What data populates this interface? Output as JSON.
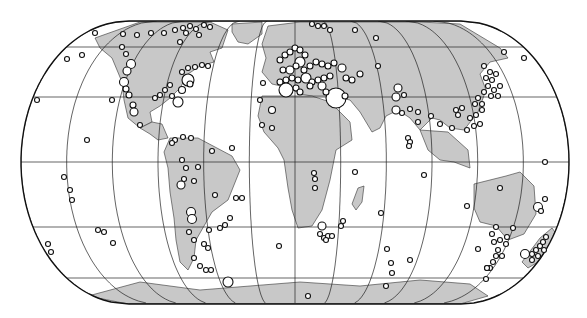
{
  "map": {
    "projection": "Eckert IV (pseudocylindrical, equal-area)",
    "center_x": 295,
    "equator_y": 162,
    "top_y": 21,
    "bottom_y": 304,
    "half_width": 274,
    "flat_half_width": 166,
    "parallels_y": [
      21,
      47,
      97,
      162,
      227,
      278,
      304
    ],
    "meridian_count": 13,
    "colors": {
      "land": "#c8c8c8",
      "ocean": "#ffffff",
      "lines": "#222222",
      "marker_fill": "#ffffff",
      "marker_stroke": "#111111"
    }
  },
  "land": [
    {
      "name": "north-america",
      "points": "95,38 140,22 210,22 228,30 222,48 210,52 214,62 200,66 188,74 180,88 170,98 160,106 150,112 152,122 140,128 128,118 124,100 122,82 112,58 100,48"
    },
    {
      "name": "greenland",
      "points": "232,24 262,22 262,34 248,44 238,42 232,32"
    },
    {
      "name": "central-america",
      "points": "140,128 152,122 162,124 168,138 158,140 150,134"
    },
    {
      "name": "south-america",
      "points": "170,138 198,138 232,156 240,170 228,200 212,212 204,226 196,240 194,258 188,270 180,262 176,240 174,218 170,192 168,168 164,152"
    },
    {
      "name": "europe-asia",
      "points": "262,44 268,26 300,22 330,22 420,22 460,24 480,36 500,48 508,58 490,62 480,74 486,90 478,112 464,130 450,128 440,120 432,118 420,130 410,118 398,110 386,116 380,128 372,132 360,112 350,100 330,96 312,96 300,94 290,88 272,84 262,72 266,58"
    },
    {
      "name": "africa",
      "points": "262,96 312,96 330,102 350,122 352,140 336,150 330,180 322,210 312,226 298,228 292,210 288,188 284,160 278,148 264,132 258,116"
    },
    {
      "name": "madagascar",
      "points": "358,188 364,186 362,202 356,210 352,204"
    },
    {
      "name": "southeast-asia",
      "points": "420,130 448,132 468,150 470,168 454,162 440,160 428,150"
    },
    {
      "name": "australia",
      "points": "474,184 506,176 520,172 534,186 536,214 524,234 508,240 496,226 480,222 474,208"
    },
    {
      "name": "new-zealand",
      "points": "540,238 552,228 558,236 548,256 528,268 522,262"
    },
    {
      "name": "antarctica",
      "points": "88,296 140,282 200,290 250,286 300,282 360,286 420,280 470,284 488,296 460,304 128,304"
    }
  ],
  "markers": [
    {
      "x": 95,
      "y": 33,
      "r": 2.5
    },
    {
      "x": 123,
      "y": 34,
      "r": 2.5
    },
    {
      "x": 137,
      "y": 35,
      "r": 2.5
    },
    {
      "x": 151,
      "y": 33,
      "r": 2.5
    },
    {
      "x": 164,
      "y": 33,
      "r": 2.5
    },
    {
      "x": 175,
      "y": 30,
      "r": 2.5
    },
    {
      "x": 183,
      "y": 28,
      "r": 2.5
    },
    {
      "x": 190,
      "y": 26,
      "r": 2.5
    },
    {
      "x": 196,
      "y": 29,
      "r": 2.5
    },
    {
      "x": 204,
      "y": 25,
      "r": 2.5
    },
    {
      "x": 186,
      "y": 33,
      "r": 2.5
    },
    {
      "x": 199,
      "y": 35,
      "r": 2.5
    },
    {
      "x": 210,
      "y": 27,
      "r": 2.5
    },
    {
      "x": 180,
      "y": 42,
      "r": 2.5
    },
    {
      "x": 67,
      "y": 59,
      "r": 2.5
    },
    {
      "x": 82,
      "y": 55,
      "r": 2.5
    },
    {
      "x": 122,
      "y": 47,
      "r": 2.5
    },
    {
      "x": 126,
      "y": 54,
      "r": 2.5
    },
    {
      "x": 131,
      "y": 64,
      "r": 4.5
    },
    {
      "x": 127,
      "y": 71,
      "r": 4
    },
    {
      "x": 124,
      "y": 82,
      "r": 4.5
    },
    {
      "x": 126,
      "y": 89,
      "r": 3
    },
    {
      "x": 129,
      "y": 95,
      "r": 3
    },
    {
      "x": 133,
      "y": 105,
      "r": 3
    },
    {
      "x": 134,
      "y": 112,
      "r": 4
    },
    {
      "x": 140,
      "y": 125,
      "r": 2.5
    },
    {
      "x": 37,
      "y": 100,
      "r": 2.5
    },
    {
      "x": 112,
      "y": 100,
      "r": 2.5
    },
    {
      "x": 87,
      "y": 140,
      "r": 2.5
    },
    {
      "x": 182,
      "y": 72,
      "r": 2.5
    },
    {
      "x": 188,
      "y": 68,
      "r": 2.5
    },
    {
      "x": 195,
      "y": 67,
      "r": 2.5
    },
    {
      "x": 202,
      "y": 65,
      "r": 2.5
    },
    {
      "x": 208,
      "y": 66,
      "r": 2.5
    },
    {
      "x": 188,
      "y": 80,
      "r": 6
    },
    {
      "x": 190,
      "y": 84,
      "r": 3
    },
    {
      "x": 170,
      "y": 85,
      "r": 2.5
    },
    {
      "x": 165,
      "y": 90,
      "r": 2.5
    },
    {
      "x": 160,
      "y": 95,
      "r": 2.5
    },
    {
      "x": 155,
      "y": 98,
      "r": 2.5
    },
    {
      "x": 182,
      "y": 90,
      "r": 3.5
    },
    {
      "x": 178,
      "y": 102,
      "r": 5
    },
    {
      "x": 172,
      "y": 96,
      "r": 2.5
    },
    {
      "x": 263,
      "y": 83,
      "r": 2.5
    },
    {
      "x": 260,
      "y": 100,
      "r": 2.5
    },
    {
      "x": 272,
      "y": 110,
      "r": 3.5
    },
    {
      "x": 272,
      "y": 128,
      "r": 2.5
    },
    {
      "x": 262,
      "y": 125,
      "r": 2.5
    },
    {
      "x": 175,
      "y": 140,
      "r": 2.5
    },
    {
      "x": 172,
      "y": 143,
      "r": 2.5
    },
    {
      "x": 183,
      "y": 137,
      "r": 2.5
    },
    {
      "x": 191,
      "y": 138,
      "r": 2.5
    },
    {
      "x": 212,
      "y": 151,
      "r": 2.5
    },
    {
      "x": 232,
      "y": 148,
      "r": 2.5
    },
    {
      "x": 182,
      "y": 160,
      "r": 2.5
    },
    {
      "x": 186,
      "y": 168,
      "r": 2.5
    },
    {
      "x": 198,
      "y": 167,
      "r": 2.5
    },
    {
      "x": 184,
      "y": 179,
      "r": 2.5
    },
    {
      "x": 181,
      "y": 185,
      "r": 4
    },
    {
      "x": 194,
      "y": 181,
      "r": 2.5
    },
    {
      "x": 215,
      "y": 195,
      "r": 2.5
    },
    {
      "x": 236,
      "y": 198,
      "r": 2.5
    },
    {
      "x": 242,
      "y": 198,
      "r": 2.5
    },
    {
      "x": 191,
      "y": 212,
      "r": 4.5
    },
    {
      "x": 192,
      "y": 219,
      "r": 4.5
    },
    {
      "x": 189,
      "y": 232,
      "r": 2.5
    },
    {
      "x": 194,
      "y": 240,
      "r": 2.5
    },
    {
      "x": 209,
      "y": 230,
      "r": 2.5
    },
    {
      "x": 220,
      "y": 228,
      "r": 2.5
    },
    {
      "x": 225,
      "y": 225,
      "r": 2.5
    },
    {
      "x": 230,
      "y": 218,
      "r": 2.5
    },
    {
      "x": 204,
      "y": 244,
      "r": 2.5
    },
    {
      "x": 208,
      "y": 248,
      "r": 2.5
    },
    {
      "x": 194,
      "y": 258,
      "r": 2.5
    },
    {
      "x": 200,
      "y": 266,
      "r": 2.5
    },
    {
      "x": 206,
      "y": 270,
      "r": 2.5
    },
    {
      "x": 211,
      "y": 270,
      "r": 2.5
    },
    {
      "x": 98,
      "y": 230,
      "r": 2.5
    },
    {
      "x": 104,
      "y": 232,
      "r": 2.5
    },
    {
      "x": 113,
      "y": 243,
      "r": 2.5
    },
    {
      "x": 48,
      "y": 244,
      "r": 2.5
    },
    {
      "x": 51,
      "y": 252,
      "r": 2.5
    },
    {
      "x": 64,
      "y": 177,
      "r": 2.5
    },
    {
      "x": 70,
      "y": 190,
      "r": 2.5
    },
    {
      "x": 72,
      "y": 200,
      "r": 2.5
    },
    {
      "x": 228,
      "y": 282,
      "r": 5
    },
    {
      "x": 279,
      "y": 246,
      "r": 2.5
    },
    {
      "x": 308,
      "y": 296,
      "r": 2.5
    },
    {
      "x": 280,
      "y": 60,
      "r": 3
    },
    {
      "x": 285,
      "y": 55,
      "r": 3
    },
    {
      "x": 290,
      "y": 52,
      "r": 3
    },
    {
      "x": 295,
      "y": 48,
      "r": 3
    },
    {
      "x": 300,
      "y": 50,
      "r": 3
    },
    {
      "x": 305,
      "y": 55,
      "r": 3
    },
    {
      "x": 300,
      "y": 62,
      "r": 5
    },
    {
      "x": 283,
      "y": 70,
      "r": 3
    },
    {
      "x": 290,
      "y": 70,
      "r": 4
    },
    {
      "x": 296,
      "y": 66,
      "r": 3
    },
    {
      "x": 304,
      "y": 70,
      "r": 3
    },
    {
      "x": 310,
      "y": 66,
      "r": 3
    },
    {
      "x": 316,
      "y": 62,
      "r": 3
    },
    {
      "x": 322,
      "y": 64,
      "r": 3
    },
    {
      "x": 328,
      "y": 66,
      "r": 3
    },
    {
      "x": 334,
      "y": 63,
      "r": 3
    },
    {
      "x": 342,
      "y": 68,
      "r": 4
    },
    {
      "x": 280,
      "y": 82,
      "r": 3
    },
    {
      "x": 286,
      "y": 80,
      "r": 3
    },
    {
      "x": 292,
      "y": 78,
      "r": 3
    },
    {
      "x": 298,
      "y": 80,
      "r": 3
    },
    {
      "x": 306,
      "y": 78,
      "r": 5
    },
    {
      "x": 312,
      "y": 82,
      "r": 3
    },
    {
      "x": 318,
      "y": 80,
      "r": 3
    },
    {
      "x": 324,
      "y": 78,
      "r": 3
    },
    {
      "x": 330,
      "y": 76,
      "r": 3
    },
    {
      "x": 346,
      "y": 78,
      "r": 3
    },
    {
      "x": 352,
      "y": 80,
      "r": 3
    },
    {
      "x": 360,
      "y": 74,
      "r": 3
    },
    {
      "x": 286,
      "y": 90,
      "r": 7
    },
    {
      "x": 296,
      "y": 88,
      "r": 3
    },
    {
      "x": 300,
      "y": 92,
      "r": 3
    },
    {
      "x": 310,
      "y": 86,
      "r": 3
    },
    {
      "x": 322,
      "y": 86,
      "r": 4
    },
    {
      "x": 336,
      "y": 98,
      "r": 10
    },
    {
      "x": 326,
      "y": 92,
      "r": 3
    },
    {
      "x": 345,
      "y": 96,
      "r": 3
    },
    {
      "x": 312,
      "y": 24,
      "r": 2.5
    },
    {
      "x": 318,
      "y": 26,
      "r": 2.5
    },
    {
      "x": 324,
      "y": 26,
      "r": 2.5
    },
    {
      "x": 330,
      "y": 30,
      "r": 2.5
    },
    {
      "x": 355,
      "y": 30,
      "r": 2.5
    },
    {
      "x": 376,
      "y": 38,
      "r": 2.5
    },
    {
      "x": 378,
      "y": 66,
      "r": 2.5
    },
    {
      "x": 398,
      "y": 88,
      "r": 4
    },
    {
      "x": 396,
      "y": 97,
      "r": 4
    },
    {
      "x": 404,
      "y": 95,
      "r": 2.5
    },
    {
      "x": 396,
      "y": 110,
      "r": 4
    },
    {
      "x": 402,
      "y": 113,
      "r": 2.5
    },
    {
      "x": 410,
      "y": 109,
      "r": 2.5
    },
    {
      "x": 418,
      "y": 112,
      "r": 2.5
    },
    {
      "x": 431,
      "y": 116,
      "r": 2.5
    },
    {
      "x": 408,
      "y": 138,
      "r": 2.5
    },
    {
      "x": 410,
      "y": 142,
      "r": 2.5
    },
    {
      "x": 409,
      "y": 146,
      "r": 2.5
    },
    {
      "x": 418,
      "y": 122,
      "r": 2.5
    },
    {
      "x": 440,
      "y": 124,
      "r": 2.5
    },
    {
      "x": 452,
      "y": 128,
      "r": 2.5
    },
    {
      "x": 456,
      "y": 110,
      "r": 2.5
    },
    {
      "x": 462,
      "y": 108,
      "r": 2.5
    },
    {
      "x": 458,
      "y": 115,
      "r": 2.5
    },
    {
      "x": 470,
      "y": 118,
      "r": 2.5
    },
    {
      "x": 476,
      "y": 115,
      "r": 2.5
    },
    {
      "x": 482,
      "y": 110,
      "r": 2.5
    },
    {
      "x": 480,
      "y": 124,
      "r": 2.5
    },
    {
      "x": 474,
      "y": 126,
      "r": 2.5
    },
    {
      "x": 467,
      "y": 130,
      "r": 2.5
    },
    {
      "x": 484,
      "y": 66,
      "r": 2.5
    },
    {
      "x": 490,
      "y": 72,
      "r": 2.5
    },
    {
      "x": 486,
      "y": 78,
      "r": 2.5
    },
    {
      "x": 492,
      "y": 80,
      "r": 2.5
    },
    {
      "x": 496,
      "y": 74,
      "r": 2.5
    },
    {
      "x": 488,
      "y": 86,
      "r": 2.5
    },
    {
      "x": 494,
      "y": 90,
      "r": 2.5
    },
    {
      "x": 500,
      "y": 86,
      "r": 2.5
    },
    {
      "x": 498,
      "y": 96,
      "r": 2.5
    },
    {
      "x": 491,
      "y": 96,
      "r": 2.5
    },
    {
      "x": 484,
      "y": 92,
      "r": 2.5
    },
    {
      "x": 478,
      "y": 98,
      "r": 2.5
    },
    {
      "x": 482,
      "y": 104,
      "r": 2.5
    },
    {
      "x": 475,
      "y": 104,
      "r": 2.5
    },
    {
      "x": 504,
      "y": 52,
      "r": 2.5
    },
    {
      "x": 524,
      "y": 58,
      "r": 2.5
    },
    {
      "x": 545,
      "y": 162,
      "r": 2.5
    },
    {
      "x": 314,
      "y": 173,
      "r": 2.5
    },
    {
      "x": 315,
      "y": 179,
      "r": 2.5
    },
    {
      "x": 315,
      "y": 188,
      "r": 2.5
    },
    {
      "x": 322,
      "y": 226,
      "r": 4
    },
    {
      "x": 320,
      "y": 234,
      "r": 2.5
    },
    {
      "x": 324,
      "y": 238,
      "r": 2.5
    },
    {
      "x": 328,
      "y": 236,
      "r": 2.5
    },
    {
      "x": 332,
      "y": 236,
      "r": 2.5
    },
    {
      "x": 326,
      "y": 240,
      "r": 2.5
    },
    {
      "x": 343,
      "y": 221,
      "r": 2.5
    },
    {
      "x": 341,
      "y": 226,
      "r": 2.5
    },
    {
      "x": 355,
      "y": 172,
      "r": 2.5
    },
    {
      "x": 381,
      "y": 213,
      "r": 2.5
    },
    {
      "x": 387,
      "y": 249,
      "r": 2.5
    },
    {
      "x": 391,
      "y": 263,
      "r": 2.5
    },
    {
      "x": 386,
      "y": 286,
      "r": 2.5
    },
    {
      "x": 500,
      "y": 188,
      "r": 2.5
    },
    {
      "x": 467,
      "y": 206,
      "r": 2.5
    },
    {
      "x": 496,
      "y": 227,
      "r": 2.5
    },
    {
      "x": 492,
      "y": 234,
      "r": 2.5
    },
    {
      "x": 494,
      "y": 242,
      "r": 2.5
    },
    {
      "x": 500,
      "y": 240,
      "r": 2.5
    },
    {
      "x": 506,
      "y": 244,
      "r": 2.5
    },
    {
      "x": 498,
      "y": 250,
      "r": 2.5
    },
    {
      "x": 502,
      "y": 256,
      "r": 2.5
    },
    {
      "x": 496,
      "y": 256,
      "r": 2.5
    },
    {
      "x": 493,
      "y": 262,
      "r": 2.5
    },
    {
      "x": 490,
      "y": 268,
      "r": 2.5
    },
    {
      "x": 507,
      "y": 237,
      "r": 2.5
    },
    {
      "x": 513,
      "y": 228,
      "r": 2.5
    },
    {
      "x": 478,
      "y": 249,
      "r": 2.5
    },
    {
      "x": 487,
      "y": 268,
      "r": 2.5
    },
    {
      "x": 487,
      "y": 268,
      "r": 2.5
    },
    {
      "x": 538,
      "y": 207,
      "r": 4.5
    },
    {
      "x": 545,
      "y": 199,
      "r": 2.5
    },
    {
      "x": 541,
      "y": 211,
      "r": 2.5
    },
    {
      "x": 525,
      "y": 254,
      "r": 4.5
    },
    {
      "x": 532,
      "y": 254,
      "r": 2.5
    },
    {
      "x": 536,
      "y": 250,
      "r": 2.5
    },
    {
      "x": 540,
      "y": 246,
      "r": 2.5
    },
    {
      "x": 543,
      "y": 242,
      "r": 2.5
    },
    {
      "x": 546,
      "y": 237,
      "r": 2.5
    },
    {
      "x": 538,
      "y": 256,
      "r": 2.5
    },
    {
      "x": 544,
      "y": 250,
      "r": 2.5
    },
    {
      "x": 532,
      "y": 260,
      "r": 2.5
    },
    {
      "x": 486,
      "y": 279,
      "r": 2.5
    },
    {
      "x": 410,
      "y": 260,
      "r": 2.5
    },
    {
      "x": 392,
      "y": 273,
      "r": 2.5
    },
    {
      "x": 424,
      "y": 175,
      "r": 2.5
    }
  ]
}
